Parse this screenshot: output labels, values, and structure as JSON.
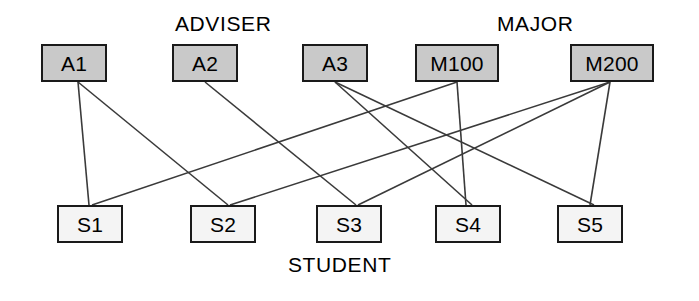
{
  "diagram": {
    "title_labels": {
      "adviser": "ADVISER",
      "major": "MAJOR",
      "student": "STUDENT"
    },
    "colors": {
      "entity_fill": "#c9c9c9",
      "student_fill": "#f4f4f4",
      "stroke": "#1a1a1a",
      "edge": "#3a3a3a",
      "background": "#ffffff"
    },
    "adviser_nodes": [
      {
        "id": "A1",
        "label": "A1",
        "x": 41,
        "y": 44,
        "w": 66,
        "h": 38
      },
      {
        "id": "A2",
        "label": "A2",
        "x": 172,
        "y": 44,
        "w": 66,
        "h": 38
      },
      {
        "id": "A3",
        "label": "A3",
        "x": 302,
        "y": 44,
        "w": 66,
        "h": 38
      }
    ],
    "major_nodes": [
      {
        "id": "M100",
        "label": "M100",
        "x": 415,
        "y": 44,
        "w": 84,
        "h": 38
      },
      {
        "id": "M200",
        "label": "M200",
        "x": 570,
        "y": 44,
        "w": 84,
        "h": 38
      }
    ],
    "student_nodes": [
      {
        "id": "S1",
        "label": "S1",
        "x": 57,
        "y": 205,
        "w": 66,
        "h": 38
      },
      {
        "id": "S2",
        "label": "S2",
        "x": 190,
        "y": 205,
        "w": 66,
        "h": 38
      },
      {
        "id": "S3",
        "label": "S3",
        "x": 316,
        "y": 205,
        "w": 66,
        "h": 38
      },
      {
        "id": "S4",
        "label": "S4",
        "x": 435,
        "y": 205,
        "w": 66,
        "h": 38
      },
      {
        "id": "S5",
        "label": "S5",
        "x": 557,
        "y": 205,
        "w": 66,
        "h": 38
      }
    ],
    "group_label_positions": {
      "adviser": {
        "x": 175,
        "y": 12
      },
      "major": {
        "x": 497,
        "y": 12
      },
      "student": {
        "x": 288,
        "y": 253
      }
    },
    "edges": [
      {
        "from": "A1",
        "to": "S1",
        "x1": 78,
        "y1": 82,
        "x2": 89,
        "y2": 205
      },
      {
        "from": "A1",
        "to": "S2",
        "x1": 78,
        "y1": 82,
        "x2": 228,
        "y2": 205
      },
      {
        "from": "A2",
        "to": "S3",
        "x1": 205,
        "y1": 82,
        "x2": 356,
        "y2": 205
      },
      {
        "from": "A3",
        "to": "S4",
        "x1": 335,
        "y1": 82,
        "x2": 472,
        "y2": 205
      },
      {
        "from": "A3",
        "to": "S5",
        "x1": 335,
        "y1": 82,
        "x2": 594,
        "y2": 205
      },
      {
        "from": "M100",
        "to": "S1",
        "x1": 457,
        "y1": 82,
        "x2": 92,
        "y2": 205
      },
      {
        "from": "M100",
        "to": "S4",
        "x1": 457,
        "y1": 82,
        "x2": 466,
        "y2": 205
      },
      {
        "from": "M200",
        "to": "S2",
        "x1": 610,
        "y1": 82,
        "x2": 230,
        "y2": 205
      },
      {
        "from": "M200",
        "to": "S3",
        "x1": 610,
        "y1": 82,
        "x2": 358,
        "y2": 205
      },
      {
        "from": "M200",
        "to": "S5",
        "x1": 610,
        "y1": 82,
        "x2": 590,
        "y2": 205
      }
    ]
  }
}
